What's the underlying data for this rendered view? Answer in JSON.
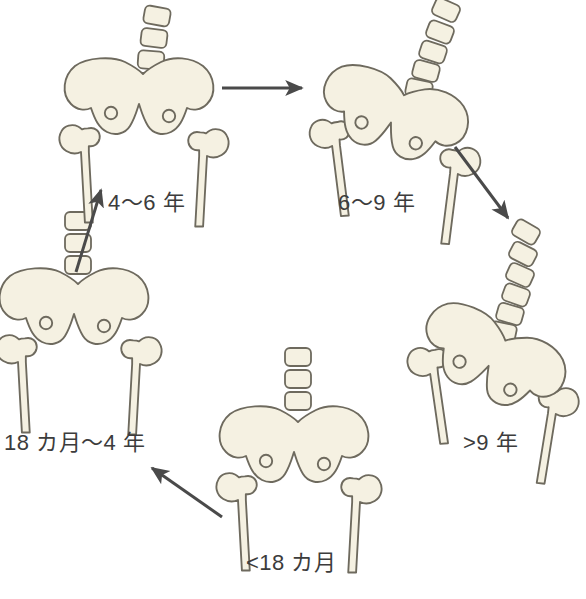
{
  "diagram": {
    "background_color": "#ffffff",
    "bone_fill_color": "#f5f1e2",
    "bone_stroke_color": "#6e6a5e",
    "arrow_color": "#4a4a4a",
    "label_color": "#3c3c3c"
  },
  "stages": [
    {
      "id": "lt18m",
      "label": "<18 カ月",
      "position": "bottom-center",
      "vertebrae_count": 3,
      "pelvis_rotation_deg": 0,
      "spine_curved": false
    },
    {
      "id": "m18-4y",
      "label": "18 カ月〜4 年",
      "position": "left",
      "vertebrae_count": 3,
      "pelvis_rotation_deg": 0,
      "spine_curved": false
    },
    {
      "id": "y4-6",
      "label": "4〜6 年",
      "position": "top-left",
      "vertebrae_count": 4,
      "pelvis_rotation_deg": 0,
      "spine_curved": true
    },
    {
      "id": "y6-9",
      "label": "6〜9 年",
      "position": "top-right",
      "vertebrae_count": 6,
      "pelvis_rotation_deg": 18,
      "spine_curved": true
    },
    {
      "id": "gt9",
      "label": ">9 年",
      "position": "right",
      "vertebrae_count": 7,
      "pelvis_rotation_deg": 26,
      "spine_curved": true
    }
  ],
  "arrows": [
    {
      "id": "arrow-lt18m-to-18m4y",
      "from": "lt18m",
      "to": "m18-4y",
      "direction": "up-left"
    },
    {
      "id": "arrow-18m4y-to-4-6",
      "from": "m18-4y",
      "to": "y4-6",
      "direction": "up-right"
    },
    {
      "id": "arrow-4-6-to-6-9",
      "from": "y4-6",
      "to": "y6-9",
      "direction": "right"
    },
    {
      "id": "arrow-6-9-to-gt9",
      "from": "y6-9",
      "to": "gt9",
      "direction": "down-right"
    }
  ]
}
